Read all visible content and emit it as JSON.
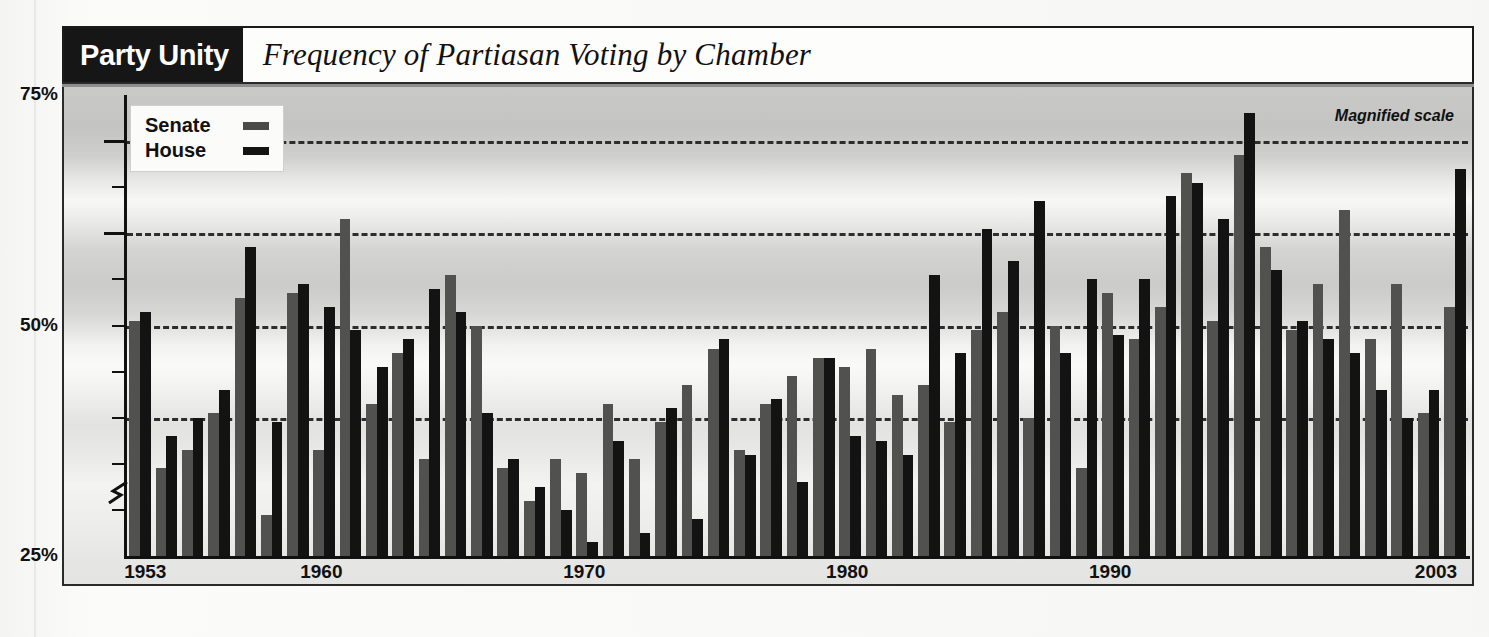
{
  "figure": {
    "kicker": "Party Unity",
    "headline": "Frequency of Partiasan Voting by Chamber",
    "annotation": "Magnified scale",
    "colors": {
      "senate": "#51514f",
      "house": "#131313",
      "kicker_background": "#161616",
      "gridline": "#2d2d2d"
    }
  },
  "legend": {
    "position": "top-left-inside",
    "entries": [
      {
        "label": "Senate",
        "swatch": "senate-swatch",
        "color": "#4a4a48"
      },
      {
        "label": "House",
        "swatch": "house-swatch",
        "color": "#141414"
      }
    ]
  },
  "axes": {
    "y_labels": [
      "75%",
      "50%",
      "25%"
    ],
    "y_min": 25,
    "y_max": 75,
    "y_break": true,
    "y_break_note": "scale break zigzag near 31%",
    "gridlines": [
      70,
      60,
      50,
      40
    ],
    "minor_ticks": [
      70,
      65,
      60,
      55,
      50,
      45,
      40,
      35,
      30
    ],
    "x_labels": [
      "1953",
      "1960",
      "1970",
      "1980",
      "1990",
      "2003"
    ]
  },
  "chart_data": {
    "type": "bar",
    "title": "Frequency of Partiasan Voting by Chamber",
    "subtitle": "Party Unity",
    "xlabel": "",
    "ylabel": "",
    "ylim": [
      25,
      75
    ],
    "grid": true,
    "legend_position": "top-left",
    "annotations": [
      "Magnified scale"
    ],
    "note": "Percent of recorded votes on which a majority of Democrats opposed a majority of Republicans. Y axis uses a magnified (broken) scale from 25% to 75%.",
    "categories": [
      1953,
      1954,
      1955,
      1956,
      1957,
      1958,
      1959,
      1960,
      1961,
      1962,
      1963,
      1964,
      1965,
      1966,
      1967,
      1968,
      1969,
      1970,
      1971,
      1972,
      1973,
      1974,
      1975,
      1976,
      1977,
      1978,
      1979,
      1980,
      1981,
      1982,
      1983,
      1984,
      1985,
      1986,
      1987,
      1988,
      1989,
      1990,
      1991,
      1992,
      1993,
      1994,
      1995,
      1996,
      1997,
      1998,
      1999,
      2000,
      2001,
      2002,
      2003
    ],
    "series": [
      {
        "name": "Senate",
        "color": "#51514f",
        "values": [
          50.5,
          34.5,
          36.5,
          40.5,
          53.0,
          29.5,
          53.5,
          36.5,
          61.5,
          41.5,
          47.0,
          35.5,
          55.5,
          50.0,
          34.5,
          31.0,
          35.5,
          34.0,
          41.5,
          35.5,
          39.5,
          43.5,
          47.5,
          36.5,
          41.5,
          44.5,
          46.5,
          45.5,
          47.5,
          42.5,
          43.5,
          39.5,
          49.5,
          51.5,
          40.0,
          50.0,
          34.5,
          53.5,
          48.5,
          52.0,
          66.5,
          50.5,
          68.5,
          58.5,
          49.5,
          54.5,
          62.5,
          48.5,
          54.5,
          40.5,
          52.0
        ]
      },
      {
        "name": "House",
        "color": "#131313",
        "values": [
          51.5,
          38.0,
          40.0,
          43.0,
          58.5,
          39.5,
          54.5,
          52.0,
          49.5,
          45.5,
          48.5,
          54.0,
          51.5,
          40.5,
          35.5,
          32.5,
          30.0,
          26.5,
          37.5,
          27.5,
          41.0,
          29.0,
          48.5,
          36.0,
          42.0,
          33.0,
          46.5,
          38.0,
          37.5,
          36.0,
          55.5,
          47.0,
          60.5,
          57.0,
          63.5,
          47.0,
          55.0,
          49.0,
          55.0,
          64.0,
          65.5,
          61.5,
          73.0,
          56.0,
          50.5,
          48.5,
          47.0,
          43.0,
          40.0,
          43.0,
          67.0
        ]
      }
    ]
  }
}
